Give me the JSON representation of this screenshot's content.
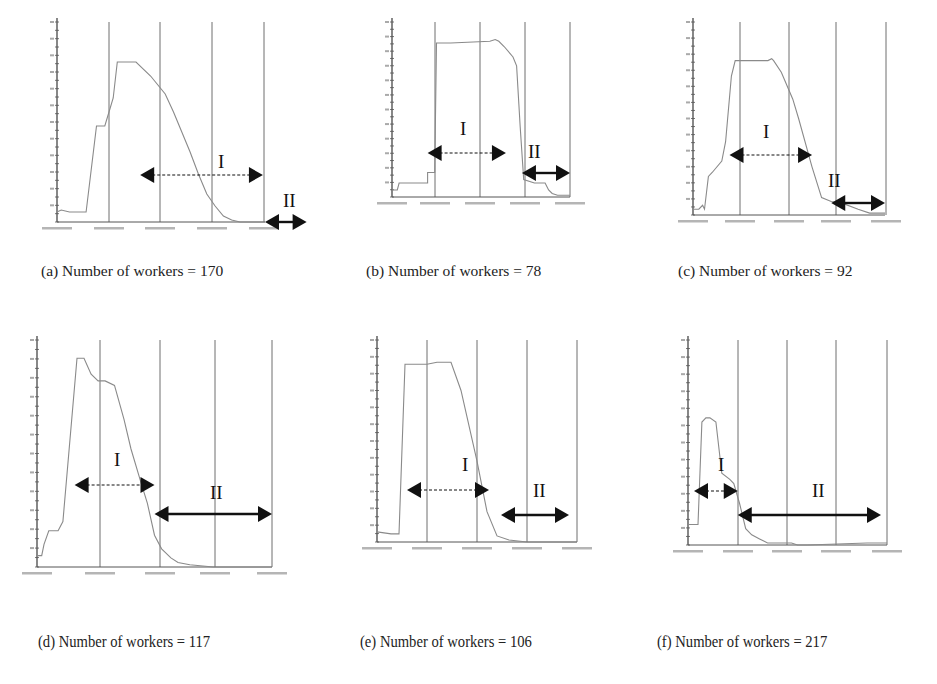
{
  "figure": {
    "captions": [
      "(a) Number of workers = 170",
      "(b) Number of workers = 78",
      "(c) Number of workers = 92",
      "(d) Number of workers = 117",
      "(e) Number of workers = 106",
      "(f) Number of workers = 217"
    ],
    "phase_labels": {
      "I": "I",
      "II": "II"
    },
    "colors": {
      "curve": "#8a8a8a",
      "grid": "#6e6e6e",
      "axis": "#555555",
      "arrow": "#111111"
    }
  },
  "chart_data": [
    {
      "type": "line",
      "panel": "a",
      "title": "(a) Number of workers = 170",
      "xlabel": "time",
      "ylabel": "active workers",
      "grid": "vertical",
      "x": [
        0,
        0.02,
        0.06,
        0.14,
        0.19,
        0.23,
        0.25,
        0.27,
        0.29,
        0.33,
        0.38,
        0.45,
        0.52,
        0.56,
        0.6,
        0.64,
        0.68,
        0.72,
        0.76,
        0.8,
        0.84,
        0.88,
        0.92,
        1.0
      ],
      "values": [
        5,
        6,
        5,
        5,
        48,
        48,
        55,
        62,
        80,
        80,
        80,
        73,
        64,
        55,
        45,
        35,
        24,
        14,
        8,
        3,
        1,
        0,
        0,
        0
      ],
      "phase_I": [
        0.4,
        0.99
      ],
      "phase_II": [
        1.0,
        1.2
      ]
    },
    {
      "type": "line",
      "panel": "b",
      "title": "(b) Number of workers = 78",
      "xlabel": "time",
      "ylabel": "active workers",
      "grid": "vertical",
      "x": [
        0,
        0.03,
        0.04,
        0.2,
        0.2,
        0.24,
        0.25,
        0.33,
        0.55,
        0.58,
        0.6,
        0.63,
        0.68,
        0.7,
        0.72,
        0.74,
        0.8,
        0.84,
        0.86,
        0.88,
        0.9,
        0.93,
        1.0
      ],
      "values": [
        4,
        4,
        8,
        8,
        14,
        14,
        88,
        88,
        89,
        90,
        89,
        86,
        80,
        75,
        40,
        10,
        8,
        8,
        8,
        4,
        2,
        1,
        1
      ],
      "phase_I": [
        0.2,
        0.64
      ],
      "phase_II": [
        0.73,
        1.0
      ]
    },
    {
      "type": "line",
      "panel": "c",
      "title": "(c) Number of workers = 92",
      "xlabel": "time",
      "ylabel": "active workers",
      "grid": "vertical",
      "x": [
        0,
        0.03,
        0.05,
        0.06,
        0.08,
        0.1,
        0.15,
        0.17,
        0.2,
        0.22,
        0.3,
        0.39,
        0.41,
        0.42,
        0.46,
        0.52,
        0.55,
        0.62,
        0.67,
        0.72,
        0.78,
        0.86,
        0.92,
        1.0
      ],
      "values": [
        3,
        3,
        5,
        3,
        20,
        22,
        28,
        38,
        72,
        80,
        80,
        80,
        81,
        80,
        74,
        60,
        50,
        25,
        9,
        7,
        6,
        3,
        1,
        1
      ],
      "phase_I": [
        0.19,
        0.62
      ],
      "phase_II": [
        0.72,
        1.0
      ]
    },
    {
      "type": "line",
      "panel": "d",
      "title": "(d) Number of workers = 117",
      "xlabel": "time",
      "ylabel": "active workers",
      "grid": "vertical",
      "x": [
        0,
        0.02,
        0.03,
        0.05,
        0.09,
        0.11,
        0.17,
        0.2,
        0.23,
        0.26,
        0.29,
        0.33,
        0.37,
        0.4,
        0.44,
        0.47,
        0.5,
        0.53,
        0.57,
        0.6,
        0.65,
        0.75,
        1.0
      ],
      "values": [
        5,
        5,
        10,
        16,
        16,
        20,
        92,
        92,
        85,
        82,
        82,
        80,
        65,
        52,
        38,
        28,
        14,
        8,
        4,
        2,
        1,
        0,
        0
      ],
      "phase_I": [
        0.16,
        0.5
      ],
      "phase_II": [
        0.5,
        1.0
      ]
    },
    {
      "type": "line",
      "panel": "e",
      "title": "(e) Number of workers = 106",
      "xlabel": "time",
      "ylabel": "active workers",
      "grid": "vertical",
      "x": [
        0,
        0.07,
        0.11,
        0.14,
        0.25,
        0.3,
        0.37,
        0.42,
        0.5,
        0.55,
        0.6,
        0.66,
        0.75,
        1.0
      ],
      "values": [
        5,
        4,
        4,
        88,
        88,
        89,
        89,
        75,
        40,
        15,
        3,
        1,
        0,
        0
      ],
      "phase_I": [
        0.15,
        0.56
      ],
      "phase_II": [
        0.62,
        0.96
      ]
    },
    {
      "type": "line",
      "panel": "f",
      "title": "(f) Number of workers = 217",
      "xlabel": "time",
      "ylabel": "active workers",
      "grid": "vertical",
      "x": [
        0,
        0.05,
        0.07,
        0.09,
        0.11,
        0.14,
        0.17,
        0.21,
        0.23,
        0.26,
        0.29,
        0.32,
        0.36,
        0.4,
        0.48,
        0.52,
        0.55,
        0.6,
        0.9,
        1.0
      ],
      "values": [
        10,
        10,
        60,
        62,
        62,
        60,
        35,
        32,
        30,
        20,
        8,
        5,
        3,
        1,
        1,
        1,
        0,
        0,
        1,
        1
      ],
      "phase_I": [
        0.03,
        0.25
      ],
      "phase_II": [
        0.25,
        0.97
      ]
    }
  ]
}
